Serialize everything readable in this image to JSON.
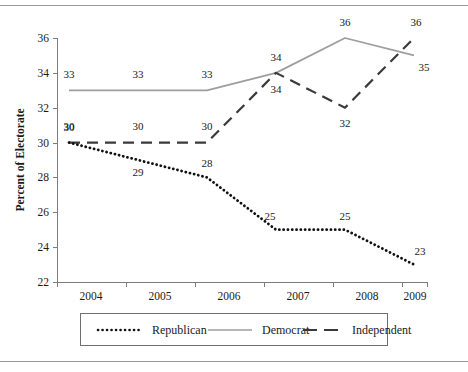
{
  "figure": {
    "title": "",
    "y_axis_title": "Percent of Electorate"
  },
  "chart_data": {
    "type": "line",
    "title": "",
    "xlabel": "",
    "ylabel": "Percent of Electorate",
    "categories": [
      "2004",
      "2005",
      "2006",
      "2007",
      "2008",
      "2009"
    ],
    "x": [
      2004,
      2005,
      2006,
      2007,
      2008,
      2009
    ],
    "ylim": [
      22,
      36
    ],
    "yticks": [
      22,
      24,
      26,
      28,
      30,
      32,
      34,
      36
    ],
    "ytick_labels": [
      "22",
      "24",
      "26",
      "28",
      "30",
      "32",
      "34",
      "36"
    ],
    "xtick_labels": [
      "2004",
      "2005",
      "2006",
      "2007",
      "2008",
      "2009"
    ],
    "grid": false,
    "legend_position": "bottom",
    "series": [
      {
        "name": "Republican",
        "style": "dotted",
        "color": "#111111",
        "values": [
          30,
          29,
          28,
          25,
          25,
          23
        ],
        "labels": [
          "30",
          "29",
          "28",
          "25",
          "25",
          "23"
        ]
      },
      {
        "name": "Democrat",
        "style": "solid",
        "color": "#9e9e9e",
        "values": [
          33,
          33,
          33,
          34,
          36,
          35
        ],
        "labels": [
          "33",
          "33",
          "33",
          "34",
          "36",
          "35"
        ]
      },
      {
        "name": "Independent",
        "style": "dashed",
        "color": "#3a3a3a",
        "values": [
          30,
          30,
          30,
          34,
          32,
          36
        ],
        "labels": [
          "30",
          "30",
          "30",
          "34",
          "32",
          "36"
        ]
      }
    ]
  },
  "legend": {
    "items": [
      {
        "label": "Republican",
        "swatch": "dotted-line-swatch"
      },
      {
        "label": "Democrat",
        "swatch": "solid-line-swatch"
      },
      {
        "label": "Independent",
        "swatch": "dashed-line-swatch"
      }
    ]
  }
}
